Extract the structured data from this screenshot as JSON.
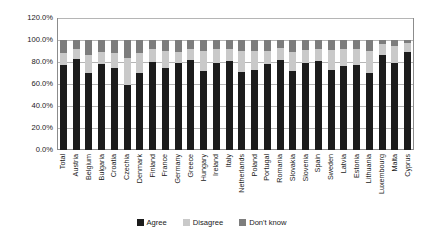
{
  "chart_data": {
    "type": "bar",
    "subtype": "stacked-column-100",
    "title": "",
    "xlabel": "",
    "ylabel": "",
    "ylim": [
      0,
      120
    ],
    "ytick_labels": [
      "0.0%",
      "20.0%",
      "40.0%",
      "60.0%",
      "80.0%",
      "100.0%",
      "120.0%"
    ],
    "ytick_values": [
      0,
      20,
      40,
      60,
      80,
      100,
      120
    ],
    "grid": true,
    "legend_position": "bottom",
    "categories": [
      "Total",
      "Austria",
      "Belgium",
      "Bulgaria",
      "Croatia",
      "Czechia",
      "Denmark",
      "Finland",
      "France",
      "Germany",
      "Greece",
      "Hungary",
      "Ireland",
      "Italy",
      "Netherlands",
      "Poland",
      "Portugal",
      "Romania",
      "Slovakia",
      "Slovenia",
      "Spain",
      "Sweden",
      "Latvia",
      "Estonia",
      "Lithuania",
      "Luxembourg",
      "Malta",
      "Cyprus"
    ],
    "series": [
      {
        "name": "Agree",
        "color": "#1c1c1c",
        "values": [
          77,
          83,
          70,
          78,
          75,
          59,
          70,
          80,
          75,
          79,
          82,
          72,
          79,
          81,
          71,
          73,
          78,
          82,
          72,
          79,
          81,
          73,
          76,
          77,
          70,
          86,
          79,
          89
        ]
      },
      {
        "name": "Disagree",
        "color": "#c9c9c9",
        "values": [
          11,
          9,
          16,
          11,
          13,
          25,
          18,
          12,
          15,
          10,
          10,
          18,
          13,
          11,
          19,
          17,
          12,
          11,
          17,
          12,
          11,
          18,
          16,
          15,
          20,
          10,
          16,
          8
        ]
      },
      {
        "name": "Don't know",
        "color": "#7d7d7d",
        "values": [
          12,
          8,
          14,
          11,
          12,
          16,
          12,
          8,
          10,
          11,
          8,
          10,
          8,
          8,
          10,
          10,
          10,
          7,
          11,
          9,
          8,
          9,
          8,
          8,
          10,
          4,
          5,
          3
        ]
      }
    ]
  },
  "legend": {
    "items": [
      {
        "label": "Agree",
        "color": "#1c1c1c"
      },
      {
        "label": "Disagree",
        "color": "#c9c9c9"
      },
      {
        "label": "Don't know",
        "color": "#7d7d7d"
      }
    ]
  }
}
